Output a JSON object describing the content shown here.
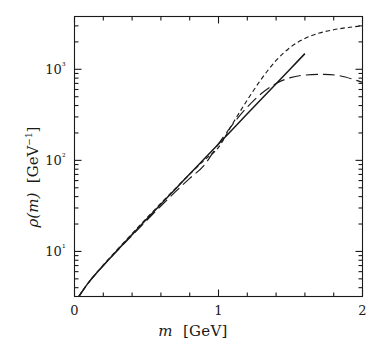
{
  "chart_data": {
    "type": "line",
    "title": "",
    "xlabel": "m  [GeV]",
    "ylabel": "ρ(m)  [GeV⁻¹]",
    "xscale": "linear",
    "yscale": "log",
    "xlim": [
      0,
      2
    ],
    "ylim": [
      3.2,
      3800
    ],
    "grid": false,
    "legend": "none",
    "x_ticks_major": [
      0,
      1,
      2
    ],
    "x_tick_labels": [
      "0",
      "1",
      "2"
    ],
    "x_ticks_minor": [
      0.2,
      0.4,
      0.6,
      0.8,
      1.2,
      1.4,
      1.6,
      1.8
    ],
    "y_ticks_major": [
      10,
      100,
      1000
    ],
    "y_tick_labels": [
      "10¹",
      "10²",
      "10³"
    ],
    "y_ticks_minor": [
      4,
      5,
      6,
      7,
      8,
      9,
      20,
      30,
      40,
      50,
      60,
      70,
      80,
      90,
      200,
      300,
      400,
      500,
      600,
      700,
      800,
      900,
      2000,
      3000
    ],
    "series": [
      {
        "name": "solid",
        "style": "solid",
        "color": "#1a1a1a",
        "x": [
          0.03,
          0.1,
          0.2,
          0.3,
          0.4,
          0.5,
          0.6,
          0.7,
          0.8,
          0.9,
          1.0,
          1.1,
          1.2,
          1.3,
          1.4,
          1.5,
          1.6
        ],
        "y": [
          3.2,
          4.6,
          7.0,
          10.4,
          15.3,
          22.5,
          33.0,
          48.3,
          70.8,
          103.5,
          151.5,
          221.6,
          324.3,
          474.5,
          694.3,
          1015.8,
          1486.0
        ]
      },
      {
        "name": "short-dash",
        "style": "short-dash",
        "color": "#1a1a1a",
        "x": [
          0.03,
          0.1,
          0.2,
          0.3,
          0.4,
          0.5,
          0.6,
          0.7,
          0.8,
          0.9,
          1.0,
          1.1,
          1.2,
          1.3,
          1.4,
          1.5,
          1.6,
          1.7,
          1.8,
          1.9,
          2.0
        ],
        "y": [
          3.2,
          4.6,
          7.1,
          10.6,
          15.7,
          23.1,
          33.8,
          49.0,
          70.5,
          100.0,
          139.0,
          256.0,
          460.0,
          790.0,
          1250.0,
          1750.0,
          2180.0,
          2500.0,
          2720.0,
          2880.0,
          3000.0
        ]
      },
      {
        "name": "long-dash",
        "style": "long-dash",
        "color": "#1a1a1a",
        "x": [
          0.03,
          0.1,
          0.2,
          0.3,
          0.4,
          0.5,
          0.6,
          0.7,
          0.8,
          0.9,
          1.0,
          1.1,
          1.2,
          1.3,
          1.4,
          1.5,
          1.6,
          1.73,
          1.85,
          2.0
        ],
        "y": [
          3.2,
          4.6,
          7.0,
          10.3,
          15.0,
          21.8,
          31.5,
          45.0,
          63.5,
          88.0,
          152.0,
          250.0,
          385.0,
          545.0,
          700.0,
          810.0,
          865.0,
          880.0,
          845.0,
          720.0
        ]
      }
    ]
  },
  "labels": {
    "x_axis_title_var": "m",
    "x_axis_title_unit": "[GeV]",
    "y_axis_title_var": "ρ(m)",
    "y_axis_title_unit": "[GeV",
    "y_axis_title_exp": "−1",
    "y_axis_title_close": "]"
  }
}
